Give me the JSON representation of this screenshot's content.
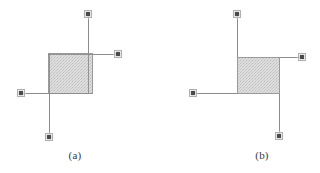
{
  "figure": {
    "width": 320,
    "height": 173,
    "background_color": "#ffffff",
    "line_color": "#8c8c8c",
    "node_fill_color": "#4a4a4a",
    "node_halo_color": "#cfcfcf",
    "square_fill_color": "#d6d6d6",
    "square_border_color": "#9a9a9a",
    "caption_color": "#3a3a3a",
    "panels": [
      {
        "id": "a",
        "caption": "(a)",
        "caption_x": 75,
        "caption_y": 157,
        "square": {
          "x": 48,
          "y": 53,
          "width": 44,
          "height": 40
        },
        "edges": [
          {
            "name": "top-edge",
            "from_x": 88,
            "from_y": 14,
            "to_x": 88,
            "to_y": 93,
            "orientation": "vertical"
          },
          {
            "name": "right-edge",
            "from_x": 118,
            "from_y": 54,
            "to_x": 48,
            "to_y": 54,
            "orientation": "horizontal"
          },
          {
            "name": "left-edge",
            "from_x": 21,
            "from_y": 93,
            "to_x": 92,
            "to_y": 93,
            "orientation": "horizontal"
          },
          {
            "name": "bottom-edge",
            "from_x": 49,
            "from_y": 137,
            "to_x": 49,
            "to_y": 53,
            "orientation": "vertical"
          }
        ],
        "nodes": [
          {
            "name": "node-top",
            "x": 88,
            "y": 14
          },
          {
            "name": "node-right",
            "x": 118,
            "y": 54
          },
          {
            "name": "node-left",
            "x": 21,
            "y": 93
          },
          {
            "name": "node-bottom",
            "x": 49,
            "y": 137
          }
        ]
      },
      {
        "id": "b",
        "caption": "(b)",
        "caption_x": 262,
        "caption_y": 157,
        "square": {
          "x": 237,
          "y": 57,
          "width": 42,
          "height": 36
        },
        "edges": [
          {
            "name": "top-edge",
            "from_x": 237,
            "from_y": 14,
            "to_x": 237,
            "to_y": 57,
            "orientation": "vertical"
          },
          {
            "name": "right-edge",
            "from_x": 302,
            "from_y": 57,
            "to_x": 279,
            "to_y": 57,
            "orientation": "horizontal"
          },
          {
            "name": "left-edge",
            "from_x": 193,
            "from_y": 93,
            "to_x": 237,
            "to_y": 93,
            "orientation": "horizontal"
          },
          {
            "name": "bottom-edge",
            "from_x": 279,
            "from_y": 136,
            "to_x": 279,
            "to_y": 93,
            "orientation": "vertical"
          }
        ],
        "nodes": [
          {
            "name": "node-top",
            "x": 237,
            "y": 14
          },
          {
            "name": "node-right",
            "x": 302,
            "y": 57
          },
          {
            "name": "node-left",
            "x": 193,
            "y": 93
          },
          {
            "name": "node-bottom",
            "x": 279,
            "y": 136
          }
        ]
      }
    ]
  }
}
